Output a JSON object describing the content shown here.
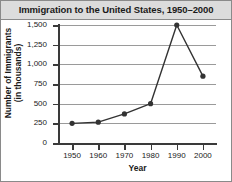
{
  "chart_data": {
    "type": "line",
    "title": "Immigration to the United States, 1950–2000",
    "xlabel": "Year",
    "ylabel": "Number of Immigrants (in thousands)",
    "ylabel_lines": [
      "Number of Immigrants",
      "(in thousands)"
    ],
    "x": [
      1950,
      1960,
      1970,
      1980,
      1990,
      2000
    ],
    "xtick_labels": [
      "1950",
      "1960",
      "1970",
      "1980",
      "1990",
      "2000"
    ],
    "values": [
      250,
      265,
      370,
      500,
      1500,
      850
    ],
    "yticks": [
      0,
      250,
      500,
      750,
      1000,
      1250,
      1500
    ],
    "ytick_labels": [
      "0",
      "250",
      "500",
      "750",
      "1,000",
      "1,250",
      "1,500"
    ],
    "ylim": [
      0,
      1500
    ],
    "xlim": [
      1945,
      2005
    ],
    "grid": "horizontal",
    "legend": "none",
    "marker": "circle",
    "series_color": "#333333",
    "grid_color": "#9a9a9a",
    "axis_color": "#3a3a3a",
    "title_band_color": "#dcdcdc"
  }
}
